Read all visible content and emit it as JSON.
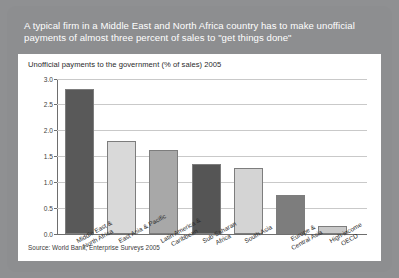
{
  "headline": "A typical firm in a Middle East and North Africa country has to make unofficial payments of almost three percent of sales to \"get things done\"",
  "panel": {
    "title": "Unofficial payments to the government (% of sales) 2005",
    "source": "Source: World Bank, Enterprise Surveys 2005"
  },
  "chart_data": {
    "type": "bar",
    "title": "Unofficial payments to the government (% of sales) 2005",
    "xlabel": "",
    "ylabel": "",
    "ylim": [
      0,
      3.0
    ],
    "yticks": [
      "0.0",
      "0.5",
      "1.0",
      "1.5",
      "2.0",
      "2.5",
      "3.0"
    ],
    "ytick_values": [
      0.0,
      0.5,
      1.0,
      1.5,
      2.0,
      2.5,
      3.0
    ],
    "grid": true,
    "legend": "none",
    "categories": [
      "Middle East & North Africa",
      "East Asia & Pacific",
      "Latin America & Caribbean",
      "Sub-Saharan Africa",
      "South Asia",
      "Europe & Central Asia",
      "High-income OECD"
    ],
    "category_lines": [
      [
        "Middle East &",
        "North Africa"
      ],
      [
        "East Asia & Pacific"
      ],
      [
        "Latin America &",
        "Caribbean"
      ],
      [
        "Sub-Saharan",
        "Africa"
      ],
      [
        "South Asia"
      ],
      [
        "Europe &",
        "Central Asia"
      ],
      [
        "High-income",
        "OECD"
      ]
    ],
    "values": [
      2.8,
      1.8,
      1.63,
      1.35,
      1.28,
      0.75,
      0.15
    ],
    "bar_colors": [
      "#595959",
      "#d9d9d9",
      "#a8a8a8",
      "#555555",
      "#d4d4d4",
      "#7d7d7d",
      "#c9c9c9"
    ],
    "source": "Source: World Bank, Enterprise Surveys 2005"
  },
  "colors": {
    "card_background": "#8d8e90",
    "panel_background": "#ffffff",
    "headline_text": "#ffffff",
    "gridline": "#c9c9c9",
    "axis": "#6e6e6e"
  }
}
